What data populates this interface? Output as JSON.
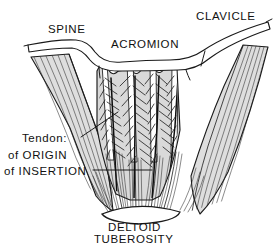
{
  "figure": {
    "background_color": "#ffffff",
    "ink_color": "#1a1a1a",
    "muscle_fill_color": "#d9d9d9",
    "tendon_fill_color": "#ffffff",
    "width": 274,
    "height": 244
  },
  "labels": {
    "spine": "SPINE",
    "acromion": "ACROMION",
    "clavicle": "CLAVICLE",
    "tendon_heading": "Tendon:",
    "tendon_origin": "of ORIGIN",
    "tendon_insertion": "of INSERTION",
    "deltoid": "DELTOID",
    "tuberosity": "TUBEROSITY"
  },
  "structures": {
    "bone": {
      "name": "scapular spine - acromion - clavicle",
      "parts": [
        "spine of scapula",
        "acromion",
        "clavicle"
      ],
      "joint": "acromioclavicular joint"
    },
    "muscle": {
      "name": "deltoid",
      "architecture": "multipennate",
      "origin_tendon_count": 4,
      "insertion_tendon_count": 3,
      "central_bundle_count": 4,
      "lateral_wing_left": "anterior clavicular fibers",
      "lateral_wing_right": "posterior spinal fibers"
    },
    "insertion_site": {
      "name": "deltoid tuberosity",
      "bone": "humerus"
    }
  },
  "leaders": [
    {
      "name": "tendon-of-origin-leader",
      "from": "Tendon:",
      "to": "origin tendon strip"
    },
    {
      "name": "tendon-of-insertion-leader",
      "from": "of INSERTION",
      "to": "insertion tendon bundle"
    }
  ]
}
